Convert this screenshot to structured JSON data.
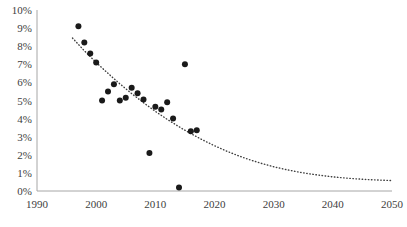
{
  "chart_data": {
    "type": "scatter",
    "title": "",
    "subtitle": "",
    "xlabel": "",
    "ylabel": "",
    "xlim": [
      1990,
      2050
    ],
    "ylim": [
      0,
      10
    ],
    "xticks": [
      1990,
      2000,
      2010,
      2020,
      2030,
      2040,
      2050
    ],
    "xtick_labels": [
      "1990",
      "2000",
      "2010",
      "2020",
      "2030",
      "2040",
      "2050"
    ],
    "yticks": [
      0,
      1,
      2,
      3,
      4,
      5,
      6,
      7,
      8,
      9,
      10
    ],
    "ytick_labels": [
      "0%",
      "1%",
      "2%",
      "3%",
      "4%",
      "5%",
      "6%",
      "7%",
      "8%",
      "9%",
      "10%"
    ],
    "grid": false,
    "legend": false,
    "legend_position": "none",
    "marker_color": "#1a1a1a",
    "marker_shape": "circle",
    "marker_size_px": 6,
    "axis_color": "#a6a6a6",
    "series": [
      {
        "name": "observations",
        "type": "scatter",
        "points": [
          {
            "x": 1997,
            "y": 9.1
          },
          {
            "x": 1998,
            "y": 8.2
          },
          {
            "x": 1999,
            "y": 7.6
          },
          {
            "x": 2000,
            "y": 7.1
          },
          {
            "x": 2001,
            "y": 5.0
          },
          {
            "x": 2002,
            "y": 5.5
          },
          {
            "x": 2003,
            "y": 5.9
          },
          {
            "x": 2004,
            "y": 5.0
          },
          {
            "x": 2005,
            "y": 5.15
          },
          {
            "x": 2006,
            "y": 5.7
          },
          {
            "x": 2007,
            "y": 5.4
          },
          {
            "x": 2008,
            "y": 5.05
          },
          {
            "x": 2009,
            "y": 2.1
          },
          {
            "x": 2010,
            "y": 4.65
          },
          {
            "x": 2011,
            "y": 4.5
          },
          {
            "x": 2012,
            "y": 4.9
          },
          {
            "x": 2013,
            "y": 4.0
          },
          {
            "x": 2014,
            "y": 0.2
          },
          {
            "x": 2015,
            "y": 7.0
          },
          {
            "x": 2016,
            "y": 3.3
          },
          {
            "x": 2017,
            "y": 3.35
          }
        ]
      },
      {
        "name": "trendline",
        "type": "line",
        "style": "dotted",
        "color": "#3f3f3f",
        "points": [
          {
            "x": 1996,
            "y": 8.45
          },
          {
            "x": 1998,
            "y": 7.75
          },
          {
            "x": 2000,
            "y": 7.1
          },
          {
            "x": 2002,
            "y": 6.5
          },
          {
            "x": 2004,
            "y": 5.92
          },
          {
            "x": 2006,
            "y": 5.38
          },
          {
            "x": 2008,
            "y": 4.88
          },
          {
            "x": 2010,
            "y": 4.4
          },
          {
            "x": 2012,
            "y": 3.96
          },
          {
            "x": 2014,
            "y": 3.55
          },
          {
            "x": 2016,
            "y": 3.17
          },
          {
            "x": 2018,
            "y": 2.82
          },
          {
            "x": 2020,
            "y": 2.5
          },
          {
            "x": 2022,
            "y": 2.21
          },
          {
            "x": 2024,
            "y": 1.95
          },
          {
            "x": 2026,
            "y": 1.72
          },
          {
            "x": 2028,
            "y": 1.52
          },
          {
            "x": 2030,
            "y": 1.34
          },
          {
            "x": 2032,
            "y": 1.19
          },
          {
            "x": 2034,
            "y": 1.06
          },
          {
            "x": 2036,
            "y": 0.95
          },
          {
            "x": 2038,
            "y": 0.86
          },
          {
            "x": 2040,
            "y": 0.78
          },
          {
            "x": 2042,
            "y": 0.72
          },
          {
            "x": 2044,
            "y": 0.67
          },
          {
            "x": 2046,
            "y": 0.63
          },
          {
            "x": 2048,
            "y": 0.6
          },
          {
            "x": 2050,
            "y": 0.58
          }
        ]
      }
    ]
  }
}
